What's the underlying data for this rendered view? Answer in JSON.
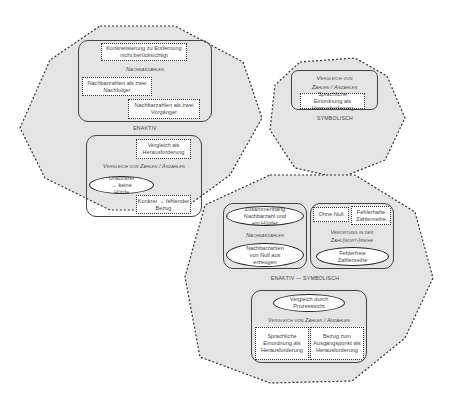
{
  "regions": {
    "enaktiv": {
      "label": "ENAKTIV",
      "nachbarzahlen": {
        "title": "Nachbarzahlen",
        "items": [
          "Konkretisierung zu Entfernung nicht berücksichtigt",
          "Nachbarzahlen als zwei Nachfolger",
          "Nachbarzahlen als zwei Vorgänger"
        ]
      },
      "vergleich": {
        "title": "Vergleich von Zahlen / Anzahlen",
        "items": [
          "Vergleich als Herausforderung",
          "Unkonkret → keine Hürde",
          "Konkret → fehlender Bezug"
        ]
      }
    },
    "symbolisch": {
      "label": "SYMBOLISCH",
      "vergleich": {
        "title_line1": "Vergleich von",
        "title_line2": "Zahlen / Anzahlen",
        "items": [
          "Sprachliche Einordnung als Herausforderung"
        ]
      }
    },
    "enaktiv_symbolisch": {
      "label": "ENAKTIV — SYMBOLISCH",
      "nachbarzahlen": {
        "title": "Nachbarzahlen",
        "items": [
          "Zusammenhang Nachbarzahl und ein Hüpfer",
          "Nachbarzahlen von Null aus erzeugen"
        ]
      },
      "verortung": {
        "title_line1": "Verortung in der",
        "title_line2": "Zahl(wort-)reihe",
        "items": [
          "Ohne Null",
          "Fehlerhafte Zahlenreihe",
          "Fehlerfreie Zahlenreihe"
        ]
      },
      "vergleich": {
        "title": "Vergleich von Zahlen / Anzahlen",
        "items": [
          "Vergleich durch Prozesssicht",
          "Sprachliche Einordnung als Herausforderung",
          "Bezug zum Ausgangspunkt als Herausforderung"
        ]
      }
    }
  },
  "colors": {
    "region_fill": "#e4e4e4",
    "border": "#333333",
    "box_fill": "#ffffff"
  }
}
